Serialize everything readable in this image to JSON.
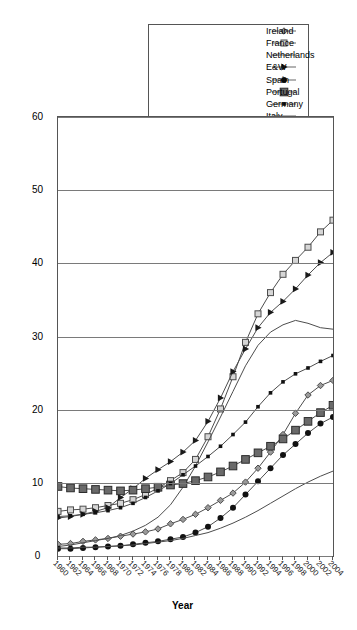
{
  "chart_data": {
    "type": "line",
    "title": "",
    "xlabel": "Year",
    "ylabel": "",
    "orientation": "rotated-90",
    "grid": true,
    "legend_position": "top-left",
    "xlim": [
      1960,
      2004
    ],
    "ylim": [
      0,
      60
    ],
    "yticks": [
      0,
      10,
      20,
      30,
      40,
      50,
      60
    ],
    "xticks": [
      1960,
      1962,
      1964,
      1966,
      1968,
      1970,
      1972,
      1974,
      1976,
      1978,
      1980,
      1982,
      1984,
      1986,
      1988,
      1990,
      1992,
      1994,
      1996,
      1998,
      2000,
      2002,
      2004
    ],
    "x": [
      1960,
      1962,
      1964,
      1966,
      1968,
      1970,
      1972,
      1974,
      1976,
      1978,
      1980,
      1982,
      1984,
      1986,
      1988,
      1990,
      1992,
      1994,
      1996,
      1998,
      2000,
      2002,
      2004
    ],
    "series": [
      {
        "name": "Ireland",
        "marker": "diamond",
        "values": [
          1.6,
          1.7,
          2.0,
          2.2,
          2.4,
          2.7,
          3.0,
          3.3,
          3.7,
          4.4,
          5.0,
          5.7,
          6.6,
          7.6,
          8.6,
          10.1,
          12.0,
          14.2,
          16.6,
          19.5,
          22.0,
          23.3,
          24.0
        ]
      },
      {
        "name": "France",
        "marker": "open-square",
        "values": [
          6.1,
          6.3,
          6.4,
          6.6,
          6.9,
          7.2,
          7.7,
          8.4,
          9.3,
          10.3,
          11.4,
          13.2,
          16.3,
          20.1,
          24.5,
          29.2,
          33.1,
          36.0,
          38.5,
          40.4,
          42.2,
          44.3,
          45.9
        ]
      },
      {
        "name": "Netherlands",
        "marker": "none",
        "values": [
          1.3,
          1.5,
          1.8,
          2.1,
          2.4,
          2.8,
          3.4,
          4.2,
          5.3,
          7.0,
          9.4,
          12.3,
          15.6,
          19.0,
          22.5,
          26.0,
          28.8,
          30.6,
          31.6,
          32.2,
          31.8,
          31.2,
          31.0
        ]
      },
      {
        "name": "E&W",
        "marker": "triangle",
        "values": [
          5.2,
          5.4,
          5.7,
          6.1,
          6.6,
          8.0,
          9.2,
          10.6,
          11.8,
          12.9,
          14.2,
          15.8,
          18.4,
          21.6,
          25.2,
          28.3,
          31.2,
          33.3,
          34.8,
          36.5,
          38.4,
          40.1,
          41.5
        ]
      },
      {
        "name": "Spain",
        "marker": "circle",
        "values": [
          1.0,
          1.0,
          1.1,
          1.2,
          1.3,
          1.4,
          1.6,
          1.8,
          2.0,
          2.3,
          2.6,
          3.2,
          4.0,
          5.2,
          6.6,
          8.4,
          10.2,
          12.0,
          13.8,
          15.3,
          16.8,
          18.1,
          19.0
        ]
      },
      {
        "name": "Portugal",
        "marker": "filled-square",
        "values": [
          9.5,
          9.3,
          9.2,
          9.1,
          9.0,
          8.9,
          9.0,
          9.2,
          9.4,
          9.7,
          9.9,
          10.3,
          10.8,
          11.5,
          12.3,
          13.2,
          14.1,
          15.0,
          16.0,
          17.2,
          18.4,
          19.6,
          20.6
        ]
      },
      {
        "name": "Germany",
        "marker": "small-square",
        "values": [
          5.4,
          5.5,
          5.7,
          5.9,
          6.2,
          6.6,
          7.2,
          8.0,
          8.9,
          9.9,
          11.1,
          12.3,
          13.6,
          15.0,
          16.6,
          18.3,
          20.4,
          22.3,
          23.8,
          24.9,
          25.7,
          26.6,
          27.4
        ]
      },
      {
        "name": "Italy",
        "marker": "none",
        "values": [
          1.1,
          1.1,
          1.2,
          1.2,
          1.3,
          1.4,
          1.5,
          1.7,
          1.9,
          2.1,
          2.4,
          2.8,
          3.2,
          3.8,
          4.5,
          5.3,
          6.2,
          7.2,
          8.2,
          9.2,
          10.1,
          10.9,
          11.6
        ]
      }
    ]
  },
  "axes": {
    "x_title": "Year",
    "y_ticks": [
      "60",
      "50",
      "40",
      "30",
      "20",
      "10",
      "0"
    ],
    "x_ticks": [
      "1960",
      "1962",
      "1964",
      "1966",
      "1968",
      "1970",
      "1972",
      "1974",
      "1976",
      "1978",
      "1980",
      "1982",
      "1984",
      "1986",
      "1988",
      "1990",
      "1992",
      "1994",
      "1996",
      "1998",
      "2000",
      "2002",
      "2004"
    ]
  },
  "legend": {
    "items": [
      {
        "label": "Ireland",
        "marker": "diamond"
      },
      {
        "label": "France",
        "marker": "open-square"
      },
      {
        "label": "Netherlands",
        "marker": "none"
      },
      {
        "label": "E&W",
        "marker": "triangle"
      },
      {
        "label": "Spain",
        "marker": "circle"
      },
      {
        "label": "Portugal",
        "marker": "filled-square"
      },
      {
        "label": "Germany",
        "marker": "small-square"
      },
      {
        "label": "Italy",
        "marker": "none"
      }
    ]
  },
  "colors": {
    "line": "#4d4d4d",
    "grid": "#7a7a7a",
    "frame": "#555555",
    "text": "#111111",
    "background": "#ffffff"
  }
}
